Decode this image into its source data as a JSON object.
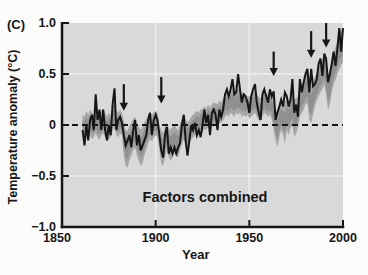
{
  "figure": {
    "panel_label": "(C)",
    "ylabel": "Temperature anomaly (°C)",
    "xlabel": "Year",
    "annotation": "Factors combined",
    "colors": {
      "page_background": "#fbfbfa",
      "plot_background": "#d9d9d9",
      "gridline": "#ededed",
      "band": "#a6a6a6",
      "band_core": "#909090",
      "line": "#161616",
      "axis": "#161616",
      "text": "#161616"
    }
  },
  "chart_data": {
    "type": "line",
    "title": "",
    "xlabel": "Year",
    "ylabel": "Temperature anomaly (°C)",
    "xlim": [
      1850,
      2000
    ],
    "ylim": [
      -1.0,
      1.0
    ],
    "x_ticks": [
      1850,
      1900,
      1950,
      2000
    ],
    "x_tick_labels": [
      "1850",
      "1900",
      "1950",
      "2000"
    ],
    "y_ticks": [
      1.0,
      0.5,
      0,
      -0.5,
      -1.0
    ],
    "y_tick_labels": [
      "1.0",
      "0.5",
      "0",
      "−0.5",
      "−1.0"
    ],
    "grid": {
      "vertical_at": [
        1900,
        1950
      ],
      "horizontal_at": [
        0.5,
        -0.5
      ]
    },
    "zero_line": {
      "value": 0,
      "style": "dashed"
    },
    "annotation": "Factors combined",
    "legend": "none",
    "x_start": 1861,
    "x_step": 1,
    "series": [
      {
        "name": "observations",
        "type": "line",
        "values": [
          -0.05,
          -0.2,
          0.0,
          -0.15,
          0.05,
          0.1,
          -0.05,
          0.3,
          0.05,
          0.15,
          -0.05,
          0.15,
          -0.05,
          -0.15,
          0.0,
          -0.1,
          0.2,
          0.36,
          -0.05,
          0.05,
          0.08,
          0.02,
          -0.1,
          -0.2,
          -0.15,
          -0.1,
          -0.22,
          -0.05,
          0.05,
          -0.2,
          -0.1,
          -0.25,
          -0.2,
          -0.15,
          -0.1,
          0.05,
          0.12,
          -0.1,
          0.05,
          0.1,
          0.05,
          -0.1,
          -0.25,
          -0.32,
          -0.1,
          -0.02,
          -0.28,
          -0.22,
          -0.28,
          -0.22,
          -0.28,
          -0.22,
          -0.18,
          0.0,
          0.1,
          -0.15,
          -0.3,
          -0.15,
          0.0,
          -0.05,
          0.02,
          -0.1,
          -0.05,
          -0.12,
          0.0,
          0.15,
          0.02,
          0.1,
          -0.1,
          0.12,
          0.15,
          0.1,
          -0.05,
          0.15,
          0.08,
          0.15,
          0.3,
          0.35,
          0.28,
          0.35,
          0.45,
          0.3,
          0.32,
          0.5,
          0.35,
          0.22,
          0.3,
          0.28,
          0.22,
          0.12,
          0.28,
          0.35,
          0.4,
          0.22,
          0.12,
          0.05,
          0.3,
          0.35,
          0.28,
          0.22,
          0.35,
          0.28,
          0.33,
          0.05,
          0.12,
          0.18,
          0.25,
          0.18,
          0.32,
          0.28,
          0.18,
          0.25,
          0.45,
          0.12,
          0.2,
          0.08,
          0.45,
          0.32,
          0.42,
          0.5,
          0.55,
          0.32,
          0.55,
          0.38,
          0.4,
          0.45,
          0.6,
          0.65,
          0.48,
          0.7,
          0.65,
          0.42,
          0.5,
          0.6,
          0.72,
          0.58,
          0.75,
          0.95,
          0.72,
          0.95
        ]
      },
      {
        "name": "model-range-band",
        "type": "band",
        "low": [
          -0.12,
          -0.15,
          -0.1,
          -0.16,
          -0.1,
          -0.14,
          -0.12,
          -0.08,
          -0.12,
          -0.15,
          -0.1,
          -0.08,
          -0.12,
          -0.16,
          -0.14,
          -0.12,
          -0.06,
          -0.02,
          -0.1,
          -0.12,
          -0.08,
          -0.1,
          -0.3,
          -0.4,
          -0.42,
          -0.35,
          -0.3,
          -0.25,
          -0.22,
          -0.3,
          -0.35,
          -0.4,
          -0.38,
          -0.3,
          -0.24,
          -0.18,
          -0.14,
          -0.16,
          -0.12,
          -0.1,
          -0.12,
          -0.25,
          -0.38,
          -0.4,
          -0.32,
          -0.25,
          -0.32,
          -0.35,
          -0.32,
          -0.28,
          -0.3,
          -0.32,
          -0.25,
          -0.18,
          -0.14,
          -0.18,
          -0.22,
          -0.18,
          -0.14,
          -0.12,
          -0.1,
          -0.08,
          -0.1,
          -0.06,
          -0.08,
          -0.04,
          -0.05,
          -0.02,
          -0.06,
          0.0,
          -0.02,
          0.02,
          -0.02,
          0.03,
          0.02,
          0.05,
          0.08,
          0.1,
          0.08,
          0.12,
          0.1,
          0.08,
          0.12,
          0.1,
          0.12,
          0.08,
          0.1,
          0.08,
          0.1,
          0.06,
          0.08,
          0.1,
          0.12,
          0.08,
          0.05,
          0.04,
          0.08,
          0.12,
          0.1,
          0.08,
          0.1,
          0.06,
          -0.05,
          -0.15,
          -0.22,
          -0.12,
          -0.05,
          -0.1,
          -0.18,
          -0.05,
          -0.1,
          -0.03,
          0.0,
          -0.12,
          -0.08,
          -0.03,
          0.08,
          0.12,
          0.15,
          0.2,
          0.22,
          0.05,
          0.02,
          0.1,
          0.18,
          0.24,
          0.28,
          0.32,
          0.35,
          0.4,
          0.3,
          0.15,
          0.2,
          0.32,
          0.4,
          0.44,
          0.5,
          0.55,
          0.58,
          0.62
        ],
        "high": [
          0.1,
          0.08,
          0.14,
          0.1,
          0.15,
          0.12,
          0.1,
          0.16,
          0.12,
          0.1,
          0.14,
          0.16,
          0.12,
          0.08,
          0.12,
          0.1,
          0.18,
          0.2,
          0.14,
          0.12,
          0.15,
          0.12,
          0.05,
          -0.05,
          -0.06,
          0.0,
          0.02,
          0.06,
          0.08,
          0.02,
          -0.02,
          -0.05,
          -0.02,
          0.03,
          0.06,
          0.1,
          0.12,
          0.1,
          0.12,
          0.14,
          0.12,
          0.0,
          -0.05,
          -0.08,
          0.0,
          0.02,
          -0.03,
          -0.05,
          -0.02,
          0.0,
          -0.03,
          -0.05,
          0.02,
          0.06,
          0.1,
          0.06,
          0.02,
          0.05,
          0.08,
          0.1,
          0.12,
          0.14,
          0.12,
          0.15,
          0.16,
          0.18,
          0.16,
          0.2,
          0.17,
          0.2,
          0.22,
          0.21,
          0.2,
          0.24,
          0.22,
          0.26,
          0.3,
          0.32,
          0.3,
          0.34,
          0.36,
          0.32,
          0.34,
          0.36,
          0.33,
          0.3,
          0.32,
          0.3,
          0.28,
          0.28,
          0.3,
          0.32,
          0.34,
          0.3,
          0.28,
          0.26,
          0.3,
          0.33,
          0.31,
          0.3,
          0.32,
          0.28,
          0.25,
          0.15,
          0.12,
          0.18,
          0.22,
          0.2,
          0.22,
          0.25,
          0.22,
          0.26,
          0.3,
          0.25,
          0.26,
          0.28,
          0.38,
          0.4,
          0.44,
          0.48,
          0.52,
          0.4,
          0.38,
          0.42,
          0.48,
          0.52,
          0.56,
          0.62,
          0.64,
          0.7,
          0.62,
          0.5,
          0.55,
          0.64,
          0.72,
          0.76,
          0.82,
          0.88,
          0.92,
          0.96
        ]
      }
    ],
    "eruption_arrows": [
      {
        "year": 1883,
        "tip": 0.14,
        "tail": 0.4
      },
      {
        "year": 1903,
        "tip": 0.21,
        "tail": 0.47
      },
      {
        "year": 1963,
        "tip": 0.48,
        "tail": 0.72
      },
      {
        "year": 1983,
        "tip": 0.66,
        "tail": 0.92
      },
      {
        "year": 1991,
        "tip": 0.76,
        "tail": 1.0
      }
    ]
  }
}
